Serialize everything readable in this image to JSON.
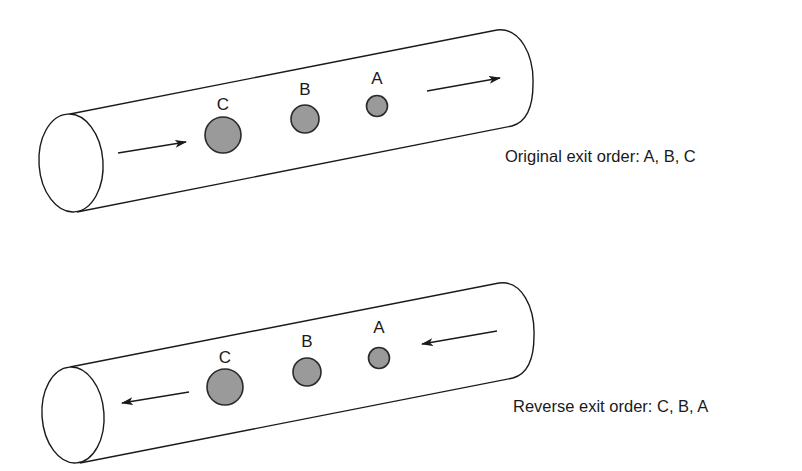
{
  "figure": {
    "colors": {
      "stroke": "#1a1a1a",
      "particle_fill": "#9a9a9a",
      "background": "#ffffff"
    },
    "panels": [
      {
        "id": "original",
        "caption": "Original exit order: A, B, C",
        "flow_direction": "left-to-right",
        "particles": [
          {
            "label": "C",
            "size": "large"
          },
          {
            "label": "B",
            "size": "medium"
          },
          {
            "label": "A",
            "size": "small"
          }
        ]
      },
      {
        "id": "reverse",
        "caption": "Reverse exit order: C, B, A",
        "flow_direction": "right-to-left",
        "particles": [
          {
            "label": "C",
            "size": "large"
          },
          {
            "label": "B",
            "size": "medium"
          },
          {
            "label": "A",
            "size": "small"
          }
        ]
      }
    ]
  }
}
